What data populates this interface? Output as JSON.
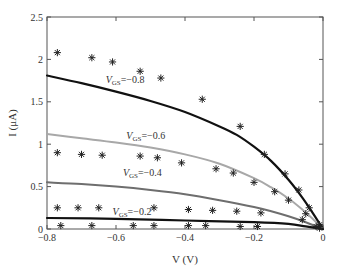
{
  "chart_data": {
    "type": "line",
    "title": "",
    "xlabel": "V (V)",
    "ylabel": "I (μA)",
    "xlim": [
      -0.8,
      0
    ],
    "ylim": [
      0,
      2.5
    ],
    "xticks": [
      -0.8,
      -0.6,
      -0.4,
      -0.2,
      0
    ],
    "xtick_labels": [
      "−0.8",
      "−0.6",
      "−0.4",
      "−0.2",
      "0"
    ],
    "yticks": [
      0,
      0.5,
      1,
      1.5,
      2,
      2.5
    ],
    "ytick_labels": [
      "0",
      "0.5",
      "1",
      "1.5",
      "2",
      "2.5"
    ],
    "grid": false,
    "legend": "none (inline annotations)",
    "series": [
      {
        "name": "VGS=-0.8 model",
        "kind": "line",
        "color": "#111111",
        "width": 2.2,
        "x": [
          -0.8,
          -0.7,
          -0.6,
          -0.5,
          -0.4,
          -0.3,
          -0.25,
          -0.2,
          -0.15,
          -0.1,
          -0.06,
          -0.03,
          0
        ],
        "y": [
          1.81,
          1.72,
          1.62,
          1.51,
          1.38,
          1.21,
          1.11,
          0.97,
          0.8,
          0.58,
          0.37,
          0.19,
          0.0
        ]
      },
      {
        "name": "VGS=-0.6 model",
        "kind": "line",
        "color": "#a8a8a8",
        "width": 2.0,
        "x": [
          -0.8,
          -0.7,
          -0.6,
          -0.5,
          -0.4,
          -0.3,
          -0.2,
          -0.15,
          -0.1,
          -0.06,
          -0.03,
          0
        ],
        "y": [
          1.12,
          1.07,
          1.02,
          0.96,
          0.88,
          0.77,
          0.6,
          0.49,
          0.36,
          0.23,
          0.12,
          0.0
        ]
      },
      {
        "name": "VGS=-0.4 model",
        "kind": "line",
        "color": "#6e6e6e",
        "width": 2.0,
        "x": [
          -0.8,
          -0.7,
          -0.6,
          -0.5,
          -0.4,
          -0.3,
          -0.2,
          -0.15,
          -0.1,
          -0.05,
          0
        ],
        "y": [
          0.55,
          0.53,
          0.5,
          0.46,
          0.41,
          0.34,
          0.26,
          0.21,
          0.15,
          0.08,
          0.0
        ]
      },
      {
        "name": "VGS=-0.2 model",
        "kind": "line",
        "color": "#111111",
        "width": 2.2,
        "x": [
          -0.8,
          -0.6,
          -0.4,
          -0.2,
          -0.1,
          -0.05,
          0
        ],
        "y": [
          0.13,
          0.12,
          0.1,
          0.08,
          0.06,
          0.03,
          0.0
        ]
      },
      {
        "name": "VGS=-0.8 measured",
        "kind": "scatter",
        "marker": "asterisk",
        "x": [
          -0.77,
          -0.67,
          -0.61,
          -0.53,
          -0.47,
          -0.35,
          -0.24,
          -0.17,
          -0.11,
          -0.07,
          -0.04,
          -0.01
        ],
        "y": [
          2.08,
          2.02,
          1.97,
          1.86,
          1.78,
          1.53,
          1.21,
          0.88,
          0.65,
          0.46,
          0.25,
          0.05
        ]
      },
      {
        "name": "VGS=-0.6 measured",
        "kind": "scatter",
        "marker": "asterisk",
        "x": [
          -0.77,
          -0.7,
          -0.64,
          -0.53,
          -0.48,
          -0.41,
          -0.31,
          -0.26,
          -0.2,
          -0.14,
          -0.1,
          -0.05,
          -0.01
        ],
        "y": [
          0.9,
          0.88,
          0.87,
          0.86,
          0.84,
          0.78,
          0.71,
          0.66,
          0.55,
          0.44,
          0.34,
          0.18,
          0.03
        ]
      },
      {
        "name": "VGS=-0.4 measured",
        "kind": "scatter",
        "marker": "asterisk",
        "x": [
          -0.77,
          -0.71,
          -0.65,
          -0.49,
          -0.39,
          -0.32,
          -0.25,
          -0.18,
          -0.06,
          -0.02
        ],
        "y": [
          0.25,
          0.25,
          0.25,
          0.25,
          0.23,
          0.22,
          0.21,
          0.19,
          0.11,
          0.03
        ]
      },
      {
        "name": "VGS=-0.2 measured",
        "kind": "scatter",
        "marker": "asterisk",
        "x": [
          -0.76,
          -0.67,
          -0.55,
          -0.49,
          -0.39,
          -0.34,
          -0.24,
          -0.19,
          -0.01
        ],
        "y": [
          0.04,
          0.04,
          0.04,
          0.04,
          0.04,
          0.04,
          0.03,
          0.03,
          0.01
        ]
      }
    ],
    "annotations": [
      {
        "text_main": "V",
        "text_sub": "GS",
        "text_rest": "=−0.8",
        "x": -0.63,
        "y": 1.72
      },
      {
        "text_main": "V",
        "text_sub": "GS",
        "text_rest": "=−0.6",
        "x": -0.57,
        "y": 1.06
      },
      {
        "text_main": "V",
        "text_sub": "GS",
        "text_rest": "=−0.4",
        "x": -0.58,
        "y": 0.62
      },
      {
        "text_main": "V",
        "text_sub": "GS",
        "text_rest": "=−0.2",
        "x": -0.61,
        "y": 0.16
      }
    ]
  }
}
